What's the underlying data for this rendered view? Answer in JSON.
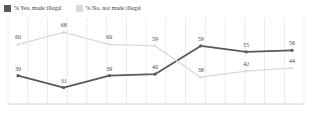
{
  "legend": {
    "items": [
      {
        "label": "% Yes, made illegal",
        "color": "#595959",
        "icon": "square-swatch-dark"
      },
      {
        "label": "% No, not made illegal",
        "color": "#d9d9d9",
        "icon": "square-swatch-light"
      }
    ]
  },
  "chart_data": {
    "type": "line",
    "title": "",
    "subtitle": "",
    "xlabel": "",
    "ylabel": "",
    "ylim": [
      20,
      75
    ],
    "grid": "vertical",
    "legend_position": "top-left",
    "x": [
      1,
      2,
      3,
      4,
      5,
      6,
      7
    ],
    "categories": [
      "",
      "",
      "",
      "",
      "",
      "",
      ""
    ],
    "series": [
      {
        "name": "% Yes, made illegal",
        "color": "#595959",
        "values": [
          39,
          31,
          39,
          40,
          59,
          55,
          56
        ],
        "labels": [
          "39",
          "31",
          "39",
          "40",
          "59",
          "55",
          "56"
        ]
      },
      {
        "name": "% No, not made illegal",
        "color": "#d9d9d9",
        "values": [
          60,
          68,
          60,
          59,
          38,
          42,
          44
        ],
        "labels": [
          "60",
          "68",
          "60",
          "59",
          "38",
          "42",
          "44"
        ]
      }
    ],
    "gridline_count": 15,
    "axis_color": "#d0d0d0"
  }
}
